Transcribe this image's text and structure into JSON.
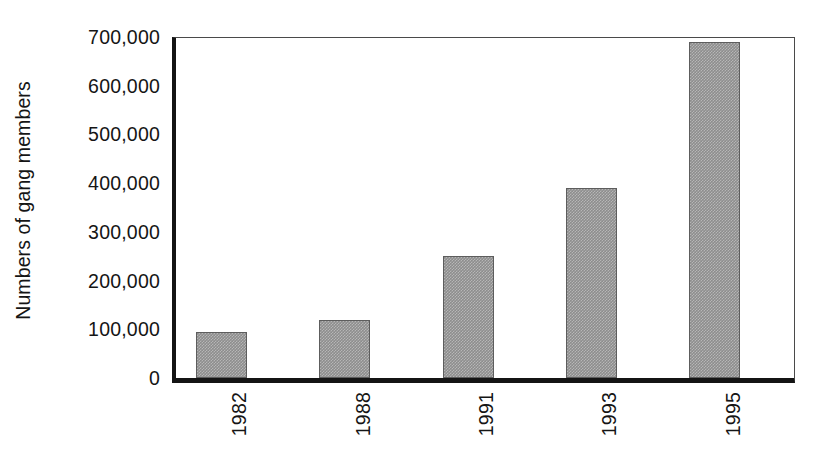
{
  "chart_data": {
    "type": "bar",
    "title": "",
    "subtitle": "",
    "xlabel": "",
    "ylabel": "Numbers of gang members",
    "categories": [
      "1982",
      "1988",
      "1991",
      "1993",
      "1995"
    ],
    "values": [
      95000,
      120000,
      250000,
      390000,
      690000
    ],
    "ylim": [
      0,
      700000
    ],
    "y_ticks": [
      0,
      100000,
      200000,
      300000,
      400000,
      500000,
      600000,
      700000
    ],
    "y_tick_labels": [
      "0",
      "100,000",
      "200,000",
      "300,000",
      "400,000",
      "500,000",
      "600,000",
      "700,000"
    ],
    "x_tick_labels": [
      "1982",
      "1988",
      "1991",
      "1993",
      "1995"
    ],
    "grid": false,
    "legend": null,
    "legend_position": "none",
    "annotations": [],
    "bar_color": "#8d8d8d",
    "bar_edge_color": "#5d5d5d",
    "axis_color": "#141414",
    "text_color": "#151515",
    "background_color": "#ffffff",
    "x_tick_rotation": -90,
    "ylabel_rotation": -90
  }
}
